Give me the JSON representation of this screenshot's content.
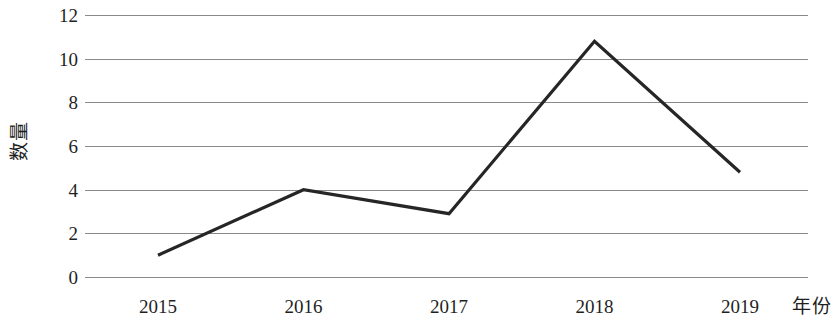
{
  "chart_data": {
    "type": "line",
    "title": "",
    "subtitle": "",
    "xlabel": "年份",
    "ylabel": "数量",
    "categories": [
      "2015",
      "2016",
      "2017",
      "2018",
      "2019"
    ],
    "values": [
      1.0,
      4.0,
      2.9,
      10.8,
      4.8
    ],
    "series": [
      {
        "name": "数量",
        "values": [
          1.0,
          4.0,
          2.9,
          10.8,
          4.8
        ]
      }
    ],
    "ylim": [
      0,
      12
    ],
    "y_ticks": [
      0,
      2,
      4,
      6,
      8,
      10,
      12
    ],
    "y_tick_labels": [
      "0",
      "2",
      "4",
      "6",
      "8",
      "10",
      "12"
    ],
    "x_tick_labels": [
      "2015",
      "2016",
      "2017",
      "2018",
      "2019"
    ],
    "grid": "horizontal",
    "legend": "none",
    "markers": "none",
    "line_color": "#262626",
    "grid_color": "#8a8a8a",
    "background_color": "#ffffff",
    "text_color": "#1f1f1f"
  }
}
